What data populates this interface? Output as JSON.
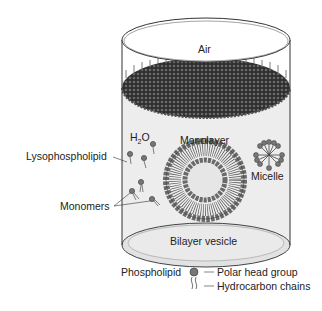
{
  "diagram": {
    "labels": {
      "air": "Air",
      "water": "H",
      "water_sub": "2",
      "water_end": "O",
      "monolayer": "Monolayer",
      "micelle": "Micelle",
      "lysophospholipid": "Lysophospholipid",
      "monomers": "Monomers",
      "bilayer_vesicle": "Bilayer vesicle"
    },
    "legend": {
      "phospholipid": "Phospholipid",
      "polar_head_group": "Polar head group",
      "hydrocarbon_chains": "Hydrocarbon chains"
    },
    "colors": {
      "head": "#7a7a7a",
      "monolayer": "#3a3a3a",
      "water": "#ececec",
      "line": "#333333"
    }
  }
}
